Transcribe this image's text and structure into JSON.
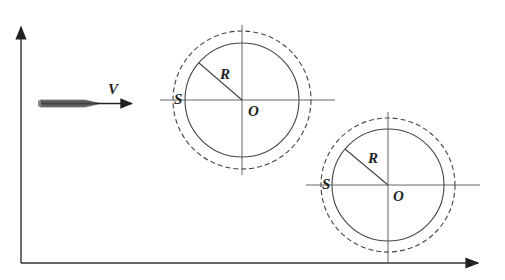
{
  "diagram": {
    "labels": {
      "velocity": "V",
      "circle1_radius": "R",
      "circle1_center": "O",
      "circle1_surface": "S",
      "circle2_radius": "R",
      "circle2_center": "O",
      "circle2_surface": "S"
    },
    "colors": {
      "line": "#444444",
      "projectile": "#555555",
      "background": "#ffffff"
    }
  }
}
